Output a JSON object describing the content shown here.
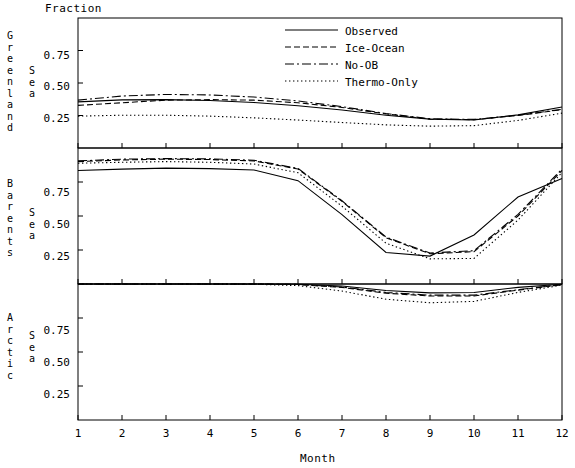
{
  "figure": {
    "y_axis_title": "Fraction",
    "x_axis_title": "Month"
  },
  "legend": {
    "entries": [
      {
        "label": "Observed",
        "style": "solid"
      },
      {
        "label": "Ice-Ocean",
        "style": "dashed"
      },
      {
        "label": "No-OB",
        "style": "dash-dot"
      },
      {
        "label": "Thermo-Only",
        "style": "dotted"
      }
    ]
  },
  "panels": [
    {
      "region": "Greenland",
      "sea_word": "Sea",
      "y_ticks": [
        "0.75",
        "0.50",
        "0.25"
      ]
    },
    {
      "region": "Barents",
      "sea_word": "Sea",
      "y_ticks": [
        "0.75",
        "0.50",
        "0.25"
      ]
    },
    {
      "region": "Arctic",
      "sea_word": "Sea",
      "y_ticks": [
        "0.75",
        "0.50",
        "0.25"
      ]
    }
  ],
  "x_ticks": [
    "1",
    "2",
    "3",
    "4",
    "5",
    "6",
    "7",
    "8",
    "9",
    "10",
    "11",
    "12"
  ],
  "chart_data": {
    "type": "line",
    "title": "",
    "xlabel": "Month",
    "ylabel": "Fraction",
    "xlim": [
      1,
      12
    ],
    "ylim": [
      0,
      1
    ],
    "grid": false,
    "legend_position": "top-right",
    "x": [
      1,
      2,
      3,
      4,
      5,
      6,
      7,
      8,
      9,
      10,
      11,
      12
    ],
    "panels": [
      {
        "name": "Greenland Sea",
        "ylim": [
          0,
          1
        ],
        "yticks": [
          0.25,
          0.5,
          0.75
        ],
        "series": [
          {
            "name": "Observed",
            "style": "solid",
            "values": [
              0.355,
              0.37,
              0.372,
              0.365,
              0.35,
              0.325,
              0.292,
              0.252,
              0.222,
              0.215,
              0.255,
              0.315
            ]
          },
          {
            "name": "Ice-Ocean",
            "style": "dashed",
            "values": [
              0.328,
              0.348,
              0.368,
              0.372,
              0.368,
              0.348,
              0.312,
              0.262,
              0.222,
              0.218,
              0.25,
              0.295
            ]
          },
          {
            "name": "No-OB",
            "style": "dash-dot",
            "values": [
              0.368,
              0.4,
              0.412,
              0.408,
              0.392,
              0.362,
              0.318,
              0.265,
              0.225,
              0.22,
              0.252,
              0.298
            ]
          },
          {
            "name": "Thermo-Only",
            "style": "dotted",
            "values": [
              0.245,
              0.252,
              0.252,
              0.245,
              0.232,
              0.215,
              0.196,
              0.178,
              0.168,
              0.172,
              0.212,
              0.268
            ]
          }
        ]
      },
      {
        "name": "Barents Sea",
        "ylim": [
          0,
          1
        ],
        "yticks": [
          0.25,
          0.5,
          0.75
        ],
        "series": [
          {
            "name": "Observed",
            "style": "solid",
            "values": [
              0.835,
              0.845,
              0.852,
              0.848,
              0.838,
              0.76,
              0.51,
              0.232,
              0.205,
              0.36,
              0.64,
              0.775
            ]
          },
          {
            "name": "Ice-Ocean",
            "style": "dashed",
            "values": [
              0.9,
              0.912,
              0.918,
              0.915,
              0.905,
              0.845,
              0.608,
              0.34,
              0.222,
              0.238,
              0.5,
              0.835
            ]
          },
          {
            "name": "No-OB",
            "style": "dash-dot",
            "values": [
              0.905,
              0.918,
              0.922,
              0.92,
              0.91,
              0.85,
              0.612,
              0.345,
              0.228,
              0.245,
              0.512,
              0.845
            ]
          },
          {
            "name": "Thermo-Only",
            "style": "dotted",
            "values": [
              0.888,
              0.895,
              0.9,
              0.895,
              0.882,
              0.818,
              0.572,
              0.3,
              0.185,
              0.188,
              0.47,
              0.82
            ]
          }
        ]
      },
      {
        "name": "Arctic Sea",
        "ylim": [
          0,
          1
        ],
        "yticks": [
          0.25,
          0.5,
          0.75
        ],
        "series": [
          {
            "name": "Observed",
            "style": "solid",
            "values": [
              1.0,
              1.0,
              1.0,
              1.0,
              1.0,
              0.998,
              0.985,
              0.952,
              0.935,
              0.938,
              0.975,
              0.998
            ]
          },
          {
            "name": "Ice-Ocean",
            "style": "dashed",
            "values": [
              1.0,
              1.0,
              1.0,
              1.0,
              1.0,
              0.996,
              0.975,
              0.932,
              0.912,
              0.912,
              0.955,
              0.995
            ]
          },
          {
            "name": "No-OB",
            "style": "dash-dot",
            "values": [
              1.0,
              1.0,
              1.0,
              1.0,
              1.0,
              0.997,
              0.978,
              0.938,
              0.918,
              0.918,
              0.958,
              0.996
            ]
          },
          {
            "name": "Thermo-Only",
            "style": "dotted",
            "values": [
              1.0,
              1.0,
              1.0,
              1.0,
              0.998,
              0.988,
              0.948,
              0.888,
              0.862,
              0.872,
              0.938,
              0.992
            ]
          }
        ]
      }
    ]
  }
}
